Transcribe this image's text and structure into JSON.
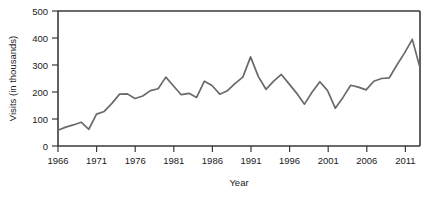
{
  "chart_data": {
    "type": "line",
    "title": "",
    "subtitle": "",
    "xlabel": "Year",
    "ylabel": "Visits (in thousands)",
    "xlim": [
      1966,
      2013
    ],
    "ylim": [
      0,
      500
    ],
    "yticks": [
      0,
      100,
      200,
      300,
      400,
      500
    ],
    "ytick_labels": [
      "0",
      "100",
      "200",
      "300",
      "400",
      "500"
    ],
    "xticks": [
      1966,
      1971,
      1976,
      1981,
      1986,
      1991,
      1996,
      2001,
      2006,
      2011
    ],
    "xtick_labels": [
      "1966",
      "1971",
      "1976",
      "1981",
      "1986",
      "1991",
      "1996",
      "2001",
      "2006",
      "2011"
    ],
    "grid": false,
    "legend": false,
    "legend_position": "none",
    "line_color": "#6a6a6a",
    "axis_color": "#3a3a3a",
    "x": [
      1966,
      1967,
      1968,
      1969,
      1970,
      1971,
      1972,
      1973,
      1974,
      1975,
      1976,
      1977,
      1978,
      1979,
      1980,
      1981,
      1982,
      1983,
      1984,
      1985,
      1986,
      1987,
      1988,
      1989,
      1990,
      1991,
      1992,
      1993,
      1994,
      1995,
      1996,
      1997,
      1998,
      1999,
      2000,
      2001,
      2002,
      2003,
      2004,
      2005,
      2006,
      2007,
      2008,
      2009,
      2010,
      2011,
      2012,
      2013
    ],
    "values": [
      58,
      70,
      78,
      88,
      62,
      118,
      128,
      158,
      192,
      193,
      176,
      185,
      205,
      212,
      255,
      222,
      190,
      195,
      180,
      240,
      224,
      192,
      205,
      232,
      255,
      330,
      258,
      210,
      240,
      265,
      230,
      195,
      155,
      200,
      238,
      205,
      140,
      180,
      225,
      218,
      208,
      240,
      250,
      252,
      300,
      345,
      395,
      290
    ],
    "series": [
      {
        "name": "Visits",
        "values": [
          58,
          70,
          78,
          88,
          62,
          118,
          128,
          158,
          192,
          193,
          176,
          185,
          205,
          212,
          255,
          222,
          190,
          195,
          180,
          240,
          224,
          192,
          205,
          232,
          255,
          330,
          258,
          210,
          240,
          265,
          230,
          195,
          155,
          200,
          238,
          205,
          140,
          180,
          225,
          218,
          208,
          240,
          250,
          252,
          300,
          345,
          395,
          290
        ]
      }
    ],
    "annotations": []
  },
  "axes": {
    "y_title": "Visits (in thousands)",
    "x_title": "Year",
    "y_tick_0": "0",
    "y_tick_1": "100",
    "y_tick_2": "200",
    "y_tick_3": "300",
    "y_tick_4": "400",
    "y_tick_5": "500",
    "x_tick_0": "1966",
    "x_tick_1": "1971",
    "x_tick_2": "1976",
    "x_tick_3": "1981",
    "x_tick_4": "1986",
    "x_tick_5": "1991",
    "x_tick_6": "1996",
    "x_tick_7": "2001",
    "x_tick_8": "2006",
    "x_tick_9": "2011"
  }
}
